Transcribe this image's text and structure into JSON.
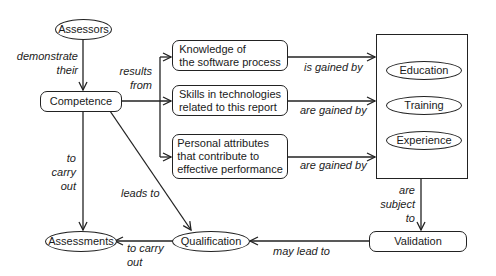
{
  "diagram": {
    "nodes": {
      "assessors": "Assessors",
      "competence": "Competence",
      "knowledge": "Knowledge of\nthe software process",
      "skills": "Skills in technologies\nrelated to this report",
      "personal": "Personal attributes\nthat contribute to\neffective performance",
      "education": "Education",
      "training": "Training",
      "experience": "Experience",
      "validation": "Validation",
      "qualification": "Qualification",
      "assessments": "Assessments"
    },
    "edges": {
      "demonstrate_their": "demonstrate\ntheir",
      "results_from": "results\nfrom",
      "is_gained_by": "is gained by",
      "are_gained_by_1": "are gained by",
      "are_gained_by_2": "are gained by",
      "to_carry_out_1": "to\ncarry\nout",
      "leads_to": "leads to",
      "are_subject_to": "are\nsubject\nto",
      "may_lead_to": "may lead to",
      "to_carry_out_2": "to carry\nout"
    }
  }
}
